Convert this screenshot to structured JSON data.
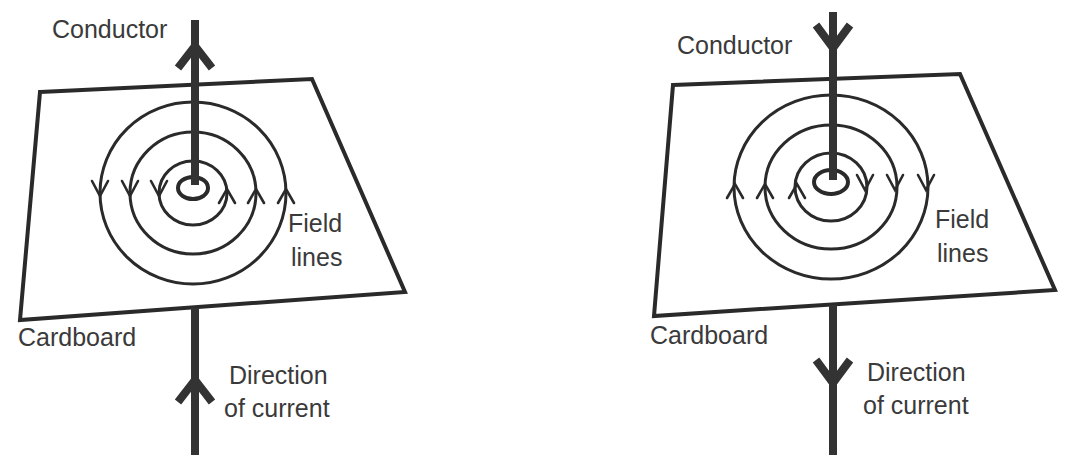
{
  "figure": {
    "colors": {
      "line": "#2a2a2a",
      "conductor": "#333333",
      "text": "#3a3a3a",
      "background": "#ffffff"
    }
  },
  "panels": [
    {
      "id": "left",
      "current_direction": "upward",
      "field_direction": "anticlockwise (viewed from above)",
      "labels": {
        "conductor": "Conductor",
        "field_line1": "Field",
        "field_line2": "lines",
        "cardboard": "Cardboard",
        "current_line1": "Direction",
        "current_line2": "of current"
      },
      "arrows_left_side": "down",
      "arrows_right_side": "up"
    },
    {
      "id": "right",
      "current_direction": "downward",
      "field_direction": "clockwise (viewed from above)",
      "labels": {
        "conductor": "Conductor",
        "field_line1": "Field",
        "field_line2": "lines",
        "cardboard": "Cardboard",
        "current_line1": "Direction",
        "current_line2": "of current"
      },
      "arrows_left_side": "up",
      "arrows_right_side": "down"
    }
  ]
}
